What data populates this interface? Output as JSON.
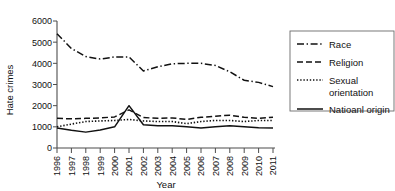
{
  "chart_data": {
    "type": "line",
    "title": "",
    "xlabel": "Year",
    "ylabel": "Hate crimes",
    "xlim": [
      1996,
      2011
    ],
    "ylim": [
      0,
      6000
    ],
    "ytick_labels": [
      "0",
      "1000",
      "2000",
      "3000",
      "4000",
      "5000",
      "6000"
    ],
    "ytick_values": [
      0,
      1000,
      2000,
      3000,
      4000,
      5000,
      6000
    ],
    "grid": false,
    "legend_position": "right",
    "categories": [
      1996,
      1997,
      1998,
      1999,
      2000,
      2001,
      2002,
      2003,
      2004,
      2005,
      2006,
      2007,
      2008,
      2009,
      2010,
      2011
    ],
    "xtick_labels": [
      "1996",
      "1997",
      "1998",
      "1999",
      "2000",
      "2001",
      "2002",
      "2003",
      "2004",
      "2005",
      "2006",
      "2007",
      "2008",
      "2009",
      "2010",
      "2011"
    ],
    "series": [
      {
        "name": "Race",
        "style": "dash-dot",
        "color": "#111111",
        "values": [
          5400,
          4700,
          4320,
          4200,
          4300,
          4300,
          3640,
          3840,
          3980,
          4000,
          4000,
          3900,
          3600,
          3200,
          3100,
          2900
        ]
      },
      {
        "name": "Religion",
        "style": "dashed",
        "color": "#111111",
        "values": [
          1400,
          1380,
          1400,
          1420,
          1470,
          1800,
          1440,
          1400,
          1420,
          1350,
          1450,
          1500,
          1550,
          1450,
          1400,
          1450
        ]
      },
      {
        "name": "Sexual orientation",
        "style": "dotted",
        "color": "#111111",
        "values": [
          1000,
          1130,
          1250,
          1280,
          1300,
          1350,
          1280,
          1250,
          1250,
          1150,
          1250,
          1300,
          1300,
          1250,
          1300,
          1300
        ]
      },
      {
        "name": "Natioanl origin",
        "style": "solid",
        "color": "#111111",
        "values": [
          950,
          840,
          750,
          850,
          1000,
          2000,
          1100,
          1050,
          1050,
          1000,
          950,
          1000,
          1050,
          1000,
          960,
          950
        ]
      }
    ]
  },
  "legend": {
    "entries": [
      {
        "label": "Race",
        "style": "dash-dot"
      },
      {
        "label": "Religion",
        "style": "dashed"
      },
      {
        "label": "Sexual",
        "label2": "orientation",
        "style": "dotted"
      },
      {
        "label": "Natioanl origin",
        "style": "solid"
      }
    ]
  },
  "axes": {
    "x_title": "Year",
    "y_title": "Hate crimes"
  }
}
